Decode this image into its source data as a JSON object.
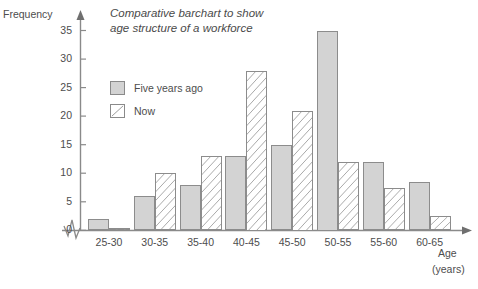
{
  "chart_data": {
    "type": "bar",
    "title": "Comparative barchart to show age structure of a workforce",
    "title_line1": "Comparative barchart to show",
    "title_line2": "age structure of a workforce",
    "xlabel": "Age",
    "xlabel_units": "(years)",
    "ylabel": "Frequency",
    "ylim": [
      0,
      35
    ],
    "ytick_labels": [
      "35",
      "30",
      "25",
      "20",
      "15",
      "10",
      "5",
      "0"
    ],
    "yticks": [
      35,
      30,
      25,
      20,
      15,
      10,
      5,
      0
    ],
    "grid": false,
    "legend_position": "upper-left-inside",
    "axis_break": "zigzag-near-origin",
    "categories": [
      "25-30",
      "30-35",
      "35-40",
      "40-45",
      "45-50",
      "50-55",
      "55-60",
      "60-65"
    ],
    "series": [
      {
        "name": "Five years ago",
        "style": "solid-grey",
        "color": "#d3d3d3",
        "values": [
          2,
          6,
          8,
          13,
          15,
          35,
          12,
          8.5
        ]
      },
      {
        "name": "Now",
        "style": "white-diagonal-hatch",
        "color": "#ffffff",
        "values": [
          0.5,
          10,
          13,
          28,
          21,
          12,
          7.5,
          2.5
        ]
      }
    ]
  },
  "colors": {
    "bar_fill_grey": "#d3d3d3",
    "bar_fill_hatch": "#ffffff",
    "bar_border": "#8c8c8c",
    "axis": "#8a8a8a",
    "text": "#4d4d4d"
  }
}
